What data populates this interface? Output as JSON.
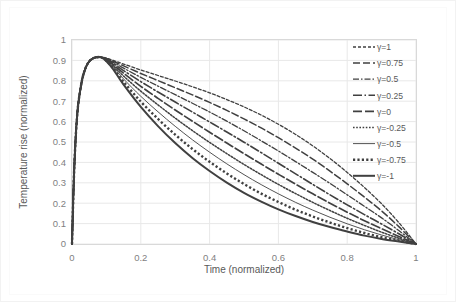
{
  "chart_data": {
    "type": "line",
    "title": "",
    "xlabel": "Time (normalized)",
    "ylabel": "Temperature rise (normalized)",
    "xlim": [
      0,
      1
    ],
    "ylim": [
      0,
      1
    ],
    "xticks": [
      "0",
      "0.2",
      "0.4",
      "0.6",
      "0.8",
      "1"
    ],
    "xtick_values": [
      0,
      0.2,
      0.4,
      0.6,
      0.8,
      1
    ],
    "yticks": [
      "0",
      "0.1",
      "0.2",
      "0.3",
      "0.4",
      "0.5",
      "0.6",
      "0.7",
      "0.8",
      "0.9",
      "1"
    ],
    "ytick_values": [
      0,
      0.1,
      0.2,
      0.3,
      0.4,
      0.5,
      0.6,
      0.7,
      0.8,
      0.9,
      1
    ],
    "grid": true,
    "grid_color": "#e8e8e8",
    "legend_position": "right-top",
    "line_color": "#404040",
    "peak": {
      "x": 0.085,
      "y": 0.915
    },
    "x": [
      0,
      0.005,
      0.01,
      0.015,
      0.02,
      0.03,
      0.04,
      0.05,
      0.06,
      0.07,
      0.085,
      0.1,
      0.12,
      0.15,
      0.2,
      0.25,
      0.3,
      0.35,
      0.4,
      0.45,
      0.5,
      0.55,
      0.6,
      0.65,
      0.7,
      0.75,
      0.8,
      0.85,
      0.9,
      0.95,
      1
    ],
    "series": [
      {
        "name": "γ=1",
        "label": "γ=1",
        "gamma": 1,
        "dash": "3,2",
        "width": 1.3,
        "values": [
          0,
          0.3,
          0.5,
          0.63,
          0.71,
          0.81,
          0.865,
          0.895,
          0.909,
          0.915,
          0.915,
          0.911,
          0.9,
          0.882,
          0.853,
          0.826,
          0.799,
          0.771,
          0.741,
          0.708,
          0.672,
          0.632,
          0.587,
          0.537,
          0.481,
          0.419,
          0.351,
          0.277,
          0.197,
          0.105,
          0
        ]
      },
      {
        "name": "γ=0.75",
        "label": "γ=0.75",
        "gamma": 0.75,
        "dash": "7,3",
        "width": 1.5,
        "values": [
          0,
          0.3,
          0.5,
          0.63,
          0.71,
          0.81,
          0.865,
          0.895,
          0.909,
          0.915,
          0.915,
          0.91,
          0.896,
          0.873,
          0.836,
          0.801,
          0.766,
          0.731,
          0.694,
          0.655,
          0.613,
          0.569,
          0.521,
          0.47,
          0.416,
          0.357,
          0.295,
          0.23,
          0.162,
          0.085,
          0
        ]
      },
      {
        "name": "γ=0.5",
        "label": "γ=0.5",
        "gamma": 0.5,
        "dash": "6,2,1.5,2",
        "width": 1.3,
        "values": [
          0,
          0.3,
          0.5,
          0.63,
          0.71,
          0.81,
          0.865,
          0.895,
          0.909,
          0.915,
          0.915,
          0.908,
          0.891,
          0.862,
          0.817,
          0.774,
          0.732,
          0.69,
          0.647,
          0.602,
          0.555,
          0.506,
          0.456,
          0.404,
          0.351,
          0.297,
          0.241,
          0.185,
          0.128,
          0.066,
          0
        ]
      },
      {
        "name": "γ=0.25",
        "label": "γ=0.25",
        "gamma": 0.25,
        "dash": "9,2.5,1.5,2.5",
        "width": 1.6,
        "values": [
          0,
          0.3,
          0.5,
          0.63,
          0.71,
          0.81,
          0.865,
          0.895,
          0.909,
          0.915,
          0.915,
          0.906,
          0.886,
          0.85,
          0.796,
          0.745,
          0.696,
          0.647,
          0.598,
          0.549,
          0.499,
          0.448,
          0.396,
          0.344,
          0.292,
          0.241,
          0.192,
          0.144,
          0.098,
          0.05,
          0
        ]
      },
      {
        "name": "γ=0",
        "label": "γ=0",
        "gamma": 0,
        "dash": "9,3",
        "width": 1.7,
        "values": [
          0,
          0.3,
          0.5,
          0.63,
          0.71,
          0.81,
          0.865,
          0.895,
          0.909,
          0.915,
          0.915,
          0.904,
          0.88,
          0.837,
          0.773,
          0.714,
          0.657,
          0.602,
          0.548,
          0.495,
          0.443,
          0.392,
          0.342,
          0.293,
          0.246,
          0.2,
          0.156,
          0.114,
          0.075,
          0.037,
          0
        ]
      },
      {
        "name": "γ=-0.25",
        "label": "γ=-0.25",
        "gamma": -0.25,
        "dash": "1.6,1.6",
        "width": 1.5,
        "values": [
          0,
          0.3,
          0.5,
          0.63,
          0.71,
          0.81,
          0.865,
          0.895,
          0.909,
          0.915,
          0.915,
          0.902,
          0.874,
          0.823,
          0.749,
          0.682,
          0.617,
          0.556,
          0.498,
          0.443,
          0.39,
          0.34,
          0.292,
          0.247,
          0.204,
          0.164,
          0.126,
          0.091,
          0.058,
          0.028,
          0
        ]
      },
      {
        "name": "γ=-0.5",
        "label": "γ=-0.5",
        "gamma": -0.5,
        "dash": "",
        "width": 0.9,
        "values": [
          0,
          0.3,
          0.5,
          0.63,
          0.71,
          0.81,
          0.865,
          0.895,
          0.909,
          0.915,
          0.915,
          0.9,
          0.868,
          0.809,
          0.724,
          0.648,
          0.577,
          0.511,
          0.45,
          0.393,
          0.34,
          0.291,
          0.246,
          0.204,
          0.166,
          0.131,
          0.099,
          0.07,
          0.044,
          0.021,
          0
        ]
      },
      {
        "name": "γ=-0.75",
        "label": "γ=-0.75",
        "gamma": -0.75,
        "dash": "2.2,2.2",
        "width": 2.4,
        "values": [
          0,
          0.3,
          0.5,
          0.63,
          0.71,
          0.81,
          0.865,
          0.895,
          0.909,
          0.915,
          0.915,
          0.898,
          0.862,
          0.795,
          0.698,
          0.613,
          0.536,
          0.466,
          0.403,
          0.346,
          0.294,
          0.247,
          0.206,
          0.168,
          0.135,
          0.105,
          0.078,
          0.054,
          0.033,
          0.016,
          0
        ]
      },
      {
        "name": "γ=-1",
        "label": "γ=-1",
        "gamma": -1,
        "dash": "",
        "width": 2.0,
        "values": [
          0,
          0.3,
          0.5,
          0.63,
          0.71,
          0.81,
          0.865,
          0.895,
          0.909,
          0.915,
          0.915,
          0.896,
          0.856,
          0.781,
          0.672,
          0.578,
          0.495,
          0.422,
          0.358,
          0.301,
          0.251,
          0.208,
          0.17,
          0.137,
          0.108,
          0.083,
          0.061,
          0.041,
          0.025,
          0.012,
          0
        ]
      }
    ]
  }
}
